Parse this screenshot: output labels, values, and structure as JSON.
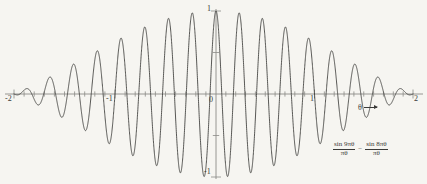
{
  "chart_data": {
    "type": "line",
    "title": "",
    "subtitle": "",
    "xlabel": "θ",
    "ylabel": "",
    "xlim": [
      -2,
      2
    ],
    "ylim": [
      -1,
      1
    ],
    "grid": false,
    "legend_position": "none",
    "formula": {
      "term1_numerator": "sin 9πθ",
      "term1_denominator": "πθ",
      "operator": "−",
      "term2_numerator": "sin 8πθ",
      "term2_denominator": "πθ"
    },
    "x_tick_labels": [
      {
        "value": -2,
        "label": "-2"
      },
      {
        "value": -1,
        "label": "-1"
      },
      {
        "value": 0,
        "label": "0"
      },
      {
        "value": 1,
        "label": "1"
      },
      {
        "value": 2,
        "label": "2"
      }
    ],
    "y_tick_labels": [
      {
        "value": 1,
        "label": "1"
      },
      {
        "value": -1,
        "label": "-1"
      }
    ],
    "minor_tick_step": 0.1,
    "axis_arrow_direction_label": "θ",
    "series": [
      {
        "name": "sin 9πθ/πθ − sin 8πθ/πθ",
        "color": "#3a3a38",
        "expression": "sin(9*pi*x)/(pi*x) - sin(8*pi*x)/(pi*x)",
        "value_at_zero": 1,
        "sample_count": 4000
      }
    ],
    "colors": {
      "background": "#f6f5f1",
      "curve": "#3a3a38",
      "axis": "#8c8c88",
      "text": "#3a3a38"
    }
  }
}
